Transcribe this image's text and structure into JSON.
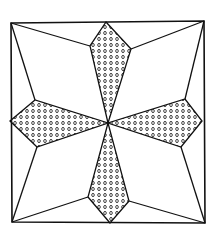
{
  "diagram": {
    "stroke_color": "#111111",
    "background": "#ffffff",
    "square": [
      [
        11,
        23
      ],
      [
        204,
        21
      ],
      [
        205,
        223
      ],
      [
        12,
        222
      ]
    ],
    "center": [
      108,
      123
    ],
    "kites": [
      {
        "name": "top",
        "points": [
          [
            106,
            22
          ],
          [
            131,
            49
          ],
          [
            108,
            123
          ],
          [
            90,
            46
          ]
        ]
      },
      {
        "name": "right",
        "points": [
          [
            202,
            121
          ],
          [
            181,
            147
          ],
          [
            108,
            123
          ],
          [
            185,
            99
          ]
        ]
      },
      {
        "name": "bottom",
        "points": [
          [
            110,
            223
          ],
          [
            88,
            197
          ],
          [
            108,
            123
          ],
          [
            129,
            201
          ]
        ]
      },
      {
        "name": "left",
        "points": [
          [
            10,
            121
          ],
          [
            35,
            100
          ],
          [
            108,
            123
          ],
          [
            37,
            147
          ]
        ]
      }
    ],
    "corner_lines": [
      [
        [
          11,
          23
        ],
        [
          35,
          100
        ]
      ],
      [
        [
          11,
          23
        ],
        [
          90,
          46
        ]
      ],
      [
        [
          204,
          21
        ],
        [
          131,
          49
        ]
      ],
      [
        [
          204,
          21
        ],
        [
          185,
          99
        ]
      ],
      [
        [
          205,
          223
        ],
        [
          181,
          147
        ]
      ],
      [
        [
          205,
          223
        ],
        [
          129,
          201
        ]
      ],
      [
        [
          12,
          222
        ],
        [
          88,
          197
        ]
      ],
      [
        [
          12,
          222
        ],
        [
          37,
          147
        ]
      ]
    ],
    "fill_pattern": "dots"
  }
}
